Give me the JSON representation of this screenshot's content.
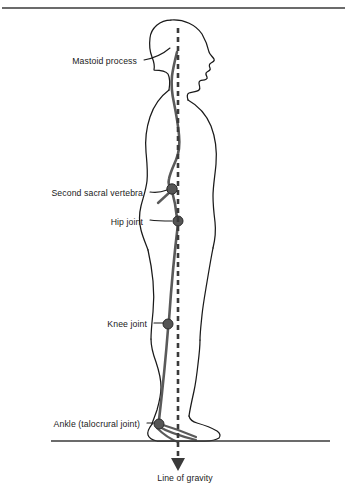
{
  "figure": {
    "title_rule": "top-divider",
    "ground_label": "ground-line",
    "colors": {
      "outline": "#1a1a1a",
      "skeleton": "#5a5a5a",
      "joint_fill": "#555555",
      "joint_stroke": "#2b2b2b",
      "gravity_line": "#3a3a3a",
      "rule": "#3a3a3a",
      "text": "#1a1a1a"
    },
    "labels": [
      {
        "id": "mastoid-process",
        "text": "Mastoid process",
        "x": 137,
        "y": 62,
        "align": "right"
      },
      {
        "id": "second-sacral-vertebra",
        "text": "Second sacral vertebra",
        "x": 143,
        "y": 194,
        "align": "right"
      },
      {
        "id": "hip-joint",
        "text": "Hip joint",
        "x": 143,
        "y": 223,
        "align": "right"
      },
      {
        "id": "knee-joint",
        "text": "Knee joint",
        "x": 147,
        "y": 325,
        "align": "right"
      },
      {
        "id": "ankle-talocrural-joint",
        "text": "Ankle (talocrural joint)",
        "x": 140,
        "y": 425,
        "align": "right"
      },
      {
        "id": "line-of-gravity",
        "text": "Line of gravity",
        "x": 185,
        "y": 479,
        "align": "center"
      }
    ],
    "landmarks": [
      {
        "id": "mastoid-process",
        "cx": 178,
        "cy": 58,
        "r": 0
      },
      {
        "id": "second-sacral-vertebra",
        "cx": 172,
        "cy": 189,
        "r": 5.2
      },
      {
        "id": "hip-joint",
        "cx": 178,
        "cy": 221,
        "r": 5.0
      },
      {
        "id": "knee-joint",
        "cx": 168,
        "cy": 324,
        "r": 5.0
      },
      {
        "id": "ankle-joint",
        "cx": 159,
        "cy": 424,
        "r": 5.0
      }
    ],
    "gravity_line": {
      "x": 178,
      "y_top": 28,
      "y_bottom": 462,
      "arrow_tip_y": 470
    },
    "ground_line": {
      "x1": 51,
      "x2": 330,
      "y": 441
    },
    "top_rule": {
      "x1": 2,
      "x2": 345,
      "y": 8
    }
  }
}
